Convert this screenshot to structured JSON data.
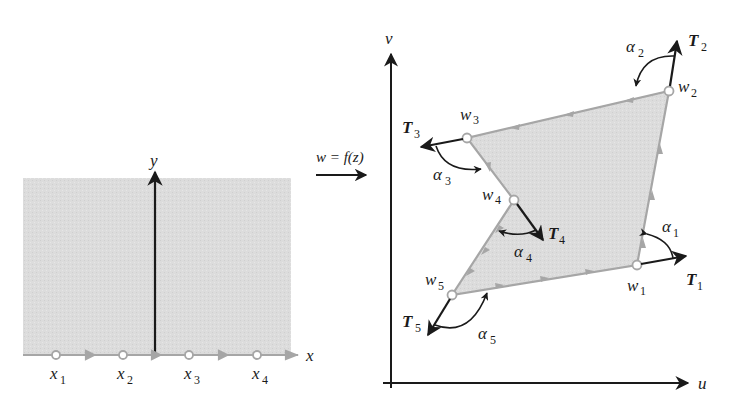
{
  "left_panel": {
    "x_axis_label": "x",
    "y_axis_label": "y",
    "points": [
      {
        "name": "x",
        "sub": "1"
      },
      {
        "name": "x",
        "sub": "2"
      },
      {
        "name": "x",
        "sub": "3"
      },
      {
        "name": "x",
        "sub": "4"
      }
    ]
  },
  "mapping": {
    "label": "w = f(z)"
  },
  "right_panel": {
    "u_axis_label": "u",
    "v_axis_label": "v",
    "vertices": [
      {
        "name": "w",
        "sub": "1"
      },
      {
        "name": "w",
        "sub": "2"
      },
      {
        "name": "w",
        "sub": "3"
      },
      {
        "name": "w",
        "sub": "4"
      },
      {
        "name": "w",
        "sub": "5"
      }
    ],
    "tangents": [
      {
        "name": "T",
        "sub": "1"
      },
      {
        "name": "T",
        "sub": "2"
      },
      {
        "name": "T",
        "sub": "3"
      },
      {
        "name": "T",
        "sub": "4"
      },
      {
        "name": "T",
        "sub": "5"
      }
    ],
    "angles": [
      {
        "name": "α",
        "sub": "1"
      },
      {
        "name": "α",
        "sub": "2"
      },
      {
        "name": "α",
        "sub": "3"
      },
      {
        "name": "α",
        "sub": "4"
      },
      {
        "name": "α",
        "sub": "5"
      }
    ]
  },
  "colors": {
    "region_fill": "#d9d9d9",
    "boundary": "#a6a6a6",
    "axis": "#1a1a1a"
  }
}
